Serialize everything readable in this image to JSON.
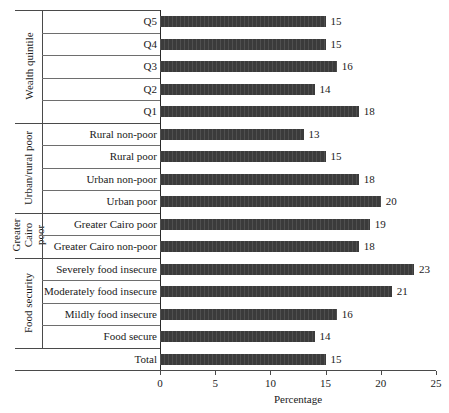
{
  "chart_data": {
    "type": "bar",
    "orientation": "horizontal",
    "title": "",
    "xlabel": "Percentage",
    "ylabel": "",
    "xlim": [
      0,
      25
    ],
    "xticks": [
      0,
      5,
      10,
      15,
      20,
      25
    ],
    "grid": false,
    "legend": null,
    "bar_color": "#3b3b3b",
    "categories": [
      "Q5",
      "Q4",
      "Q3",
      "Q2",
      "Q1",
      "Rural non-poor",
      "Rural poor",
      "Urban non-poor",
      "Urban poor",
      "Greater Cairo poor",
      "Greater Cairo non-poor",
      "Severely food insecure",
      "Moderately food insecure",
      "Mildly food insecure",
      "Food secure",
      "Total"
    ],
    "values": [
      15,
      15,
      16,
      14,
      18,
      13,
      15,
      18,
      20,
      19,
      18,
      23,
      21,
      16,
      14,
      15
    ],
    "groups": [
      {
        "label": "Wealth quintile",
        "items": [
          {
            "category": "Q5",
            "value": 15
          },
          {
            "category": "Q4",
            "value": 15
          },
          {
            "category": "Q3",
            "value": 16
          },
          {
            "category": "Q2",
            "value": 14
          },
          {
            "category": "Q1",
            "value": 18
          }
        ]
      },
      {
        "label": "Urban/rural poor",
        "items": [
          {
            "category": "Rural non-poor",
            "value": 13
          },
          {
            "category": "Rural poor",
            "value": 15
          },
          {
            "category": "Urban non-poor",
            "value": 18
          },
          {
            "category": "Urban poor",
            "value": 20
          }
        ]
      },
      {
        "label": "Greater Cairo poor",
        "items": [
          {
            "category": "Greater Cairo poor",
            "value": 19
          },
          {
            "category": "Greater Cairo non-poor",
            "value": 18
          }
        ]
      },
      {
        "label": "Food security",
        "items": [
          {
            "category": "Severely food insecure",
            "value": 23
          },
          {
            "category": "Moderately food insecure",
            "value": 21
          },
          {
            "category": "Mildly food insecure",
            "value": 16
          },
          {
            "category": "Food secure",
            "value": 14
          }
        ]
      },
      {
        "label": "",
        "items": [
          {
            "category": "Total",
            "value": 15
          }
        ]
      }
    ]
  }
}
